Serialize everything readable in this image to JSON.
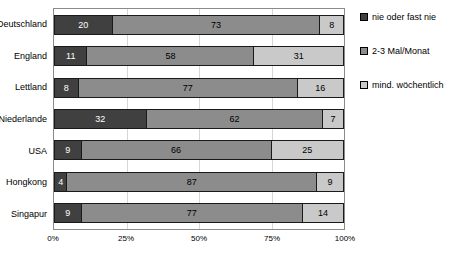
{
  "chart_data": {
    "type": "bar",
    "orientation": "horizontal",
    "stacked": true,
    "title": "",
    "xlabel": "",
    "ylabel": "",
    "xlim": [
      0,
      100
    ],
    "grid": true,
    "legend_position": "right",
    "categories": [
      "Deutschland",
      "England",
      "Lettland",
      "Niederlande",
      "USA",
      "Hongkong",
      "Singapur"
    ],
    "series": [
      {
        "name": "nie oder fast nie",
        "color": "#404040",
        "values": [
          20,
          11,
          8,
          32,
          9,
          4,
          9
        ]
      },
      {
        "name": "2-3 Mal/Monat",
        "color": "#8c8c8c",
        "values": [
          73,
          58,
          77,
          62,
          66,
          87,
          77
        ]
      },
      {
        "name": "mind. wöchentlich",
        "color": "#c9c9c9",
        "values": [
          8,
          31,
          16,
          7,
          25,
          9,
          14
        ]
      }
    ],
    "x_ticks": [
      "0%",
      "25%",
      "50%",
      "75%",
      "100%"
    ]
  },
  "colors": {
    "grid": "#d6d6d6",
    "plot_border": "#8a8a8a",
    "segment_border": "#1a1a1a"
  }
}
